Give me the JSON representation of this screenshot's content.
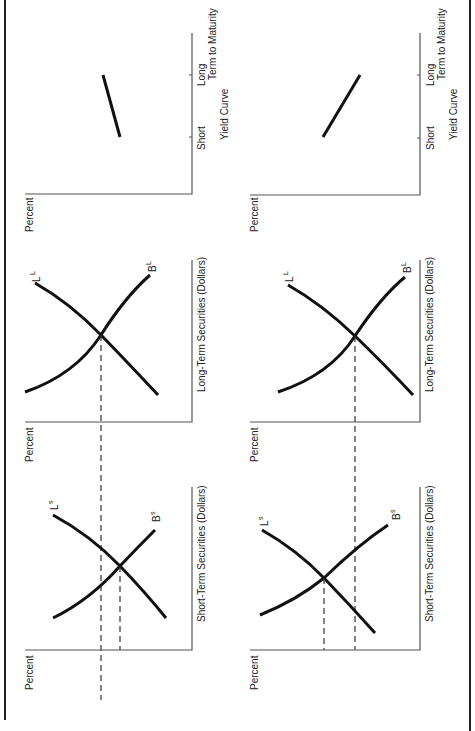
{
  "figure": {
    "orientation": "rotated 90 degrees counterclockwise",
    "panels": [
      {
        "id": "yield-top",
        "type": "yield-curve",
        "y_axis_label": "Percent",
        "x_axis_label": "Term to Maturity",
        "ticks": [
          "Short",
          "Long"
        ],
        "caption": "Yield Curve",
        "slope": "gently upward"
      },
      {
        "id": "yield-bottom",
        "type": "yield-curve",
        "y_axis_label": "Percent",
        "x_axis_label": "Term to Maturity",
        "ticks": [
          "Short",
          "Long"
        ],
        "caption": "Yield Curve",
        "slope": "steeply upward"
      },
      {
        "id": "long-top",
        "type": "market",
        "y_axis_label": "Percent",
        "x_axis_label": "Long-Term Securities (Dollars)",
        "curves": [
          {
            "name": "L",
            "sup": "L"
          },
          {
            "name": "B",
            "sup": "L"
          }
        ]
      },
      {
        "id": "long-bottom",
        "type": "market",
        "y_axis_label": "Percent",
        "x_axis_label": "Long-Term Securities (Dollars)",
        "curves": [
          {
            "name": "L",
            "sup": "L"
          },
          {
            "name": "B",
            "sup": "L"
          }
        ]
      },
      {
        "id": "short-top",
        "type": "market",
        "y_axis_label": "Percent",
        "x_axis_label": "Short-Term Securities (Dollars)",
        "curves": [
          {
            "name": "L",
            "sup": "s"
          },
          {
            "name": "B",
            "sup": "s"
          }
        ]
      },
      {
        "id": "short-bottom",
        "type": "market",
        "y_axis_label": "Percent",
        "x_axis_label": "Short-Term Securities (Dollars)",
        "curves": [
          {
            "name": "L",
            "sup": "s"
          },
          {
            "name": "B",
            "sup": "s"
          }
        ]
      }
    ]
  },
  "labels": {
    "percent": "Percent",
    "term": "Term to Maturity",
    "short": "Short",
    "long": "Long",
    "yield_curve": "Yield Curve",
    "long_term_securities": "Long-Term Securities (Dollars)",
    "short_term_securities": "Short-Term Securities (Dollars)",
    "L": "L",
    "B": "B",
    "sup_L": "L",
    "sup_s": "s"
  },
  "colors": {
    "curve": "#111111",
    "axis": "#555555",
    "text": "#222222",
    "background": "#ffffff"
  }
}
